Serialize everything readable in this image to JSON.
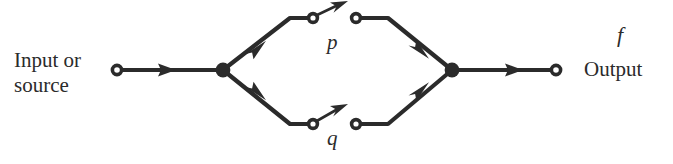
{
  "figure": {
    "kind": "signal-flow-graph",
    "background_color": "#ffffff",
    "stroke_color": "#2b2b2b",
    "title": ""
  },
  "labels": {
    "input_line1": "Input or",
    "input_line2": "source",
    "output": "Output",
    "output_variable": "f",
    "branch_upper": "p",
    "branch_lower": "q"
  },
  "nodes": [
    {
      "id": "source",
      "name": "source-node",
      "type": "open-circle",
      "x": 117,
      "y": 70
    },
    {
      "id": "split",
      "name": "branch-junction-node",
      "type": "filled-circle",
      "x": 223,
      "y": 70
    },
    {
      "id": "upper-in",
      "name": "upper-gain-input",
      "type": "open-circle",
      "x": 313,
      "y": 18
    },
    {
      "id": "upper-out",
      "name": "upper-gain-output",
      "type": "open-circle",
      "x": 356,
      "y": 18
    },
    {
      "id": "lower-in",
      "name": "lower-gain-input",
      "type": "open-circle",
      "x": 313,
      "y": 124
    },
    {
      "id": "lower-out",
      "name": "lower-gain-output",
      "type": "open-circle",
      "x": 356,
      "y": 124
    },
    {
      "id": "merge",
      "name": "summing-junction-node",
      "type": "filled-circle",
      "x": 452,
      "y": 70
    },
    {
      "id": "sink",
      "name": "output-node",
      "type": "open-circle",
      "x": 556,
      "y": 70
    }
  ],
  "edges": [
    {
      "id": "e-source-split",
      "name": "source-to-junction-edge",
      "from": "source",
      "to": "split",
      "arrow_at": [
        166,
        70
      ]
    },
    {
      "id": "e-split-upper",
      "name": "junction-to-upper-edge",
      "from": "split",
      "to": "upper-in",
      "arrow_at": [
        254,
        50
      ]
    },
    {
      "id": "e-split-lower",
      "name": "junction-to-lower-edge",
      "from": "split",
      "to": "lower-in",
      "arrow_at": [
        254,
        91
      ]
    },
    {
      "id": "e-upper-merge",
      "name": "upper-to-summing-edge",
      "from": "upper-out",
      "to": "merge",
      "arrow_at": [
        419,
        50
      ]
    },
    {
      "id": "e-lower-merge",
      "name": "lower-to-summing-edge",
      "from": "lower-out",
      "to": "merge",
      "arrow_at": [
        419,
        91
      ]
    },
    {
      "id": "e-merge-sink",
      "name": "summing-to-output-edge",
      "from": "merge",
      "to": "sink",
      "arrow_at": [
        512,
        70
      ]
    }
  ],
  "gain_arrows": [
    {
      "id": "g-upper",
      "name": "upper-gain-arrow",
      "label": "p",
      "from": [
        314,
        17
      ],
      "to": [
        345,
        2
      ]
    },
    {
      "id": "g-lower",
      "name": "lower-gain-arrow",
      "label": "q",
      "from": [
        314,
        123
      ],
      "to": [
        345,
        106
      ]
    }
  ]
}
